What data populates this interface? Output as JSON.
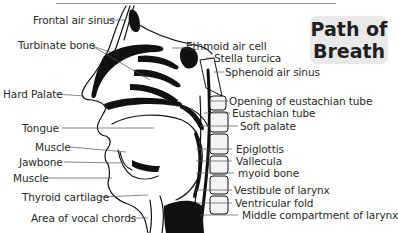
{
  "title": {
    "line1": "Path of",
    "line2": "Breath"
  },
  "labels_left": [
    "Frontal air sinus",
    "Turbinate bone",
    "Hard Palate",
    "Tongue",
    "Muscle",
    "Jawbone",
    "Muscle",
    "Thyroid cartilage",
    "Area of vocal chords"
  ],
  "labels_right": [
    "Ethmoid air cell",
    "Stella turcica",
    "Sphenoid air sinus",
    "Opening of eustachian tube",
    "Eustachian tube",
    "Soft palate",
    "Epiglottis",
    "Vallecula",
    "myoid  bone",
    "Vestibule of larynx",
    "Ventricular fold",
    "Middle compartment of larynx"
  ],
  "colors": {
    "ink": "#111111",
    "label_text": "#2a2a2a",
    "title_bg": "#e9e9e9",
    "leader": "#555555"
  }
}
